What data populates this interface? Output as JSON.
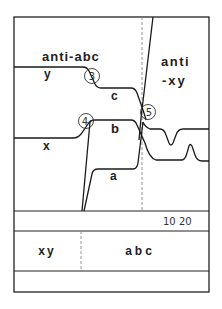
{
  "diagram": {
    "type": "developmental-timing-diagram",
    "region_labels": {
      "anti_abc": "anti-abc",
      "anti_xy_line1": "anti",
      "anti_xy_line2": "-xy"
    },
    "curve_labels": {
      "y": "y",
      "c": "c",
      "x": "x",
      "b": "b",
      "a": "a"
    },
    "markers": [
      {
        "id": "3",
        "label": "3"
      },
      {
        "id": "4",
        "label": "4"
      },
      {
        "id": "5",
        "label": "5"
      }
    ],
    "axis": {
      "ticks_label": "10 20"
    },
    "bottom_band": {
      "left_label": "xy",
      "right_label": "abc"
    },
    "colors": {
      "line": "#1a1a1a",
      "frame": "#222222",
      "dashed": "#888888",
      "background": "#ffffff"
    }
  }
}
